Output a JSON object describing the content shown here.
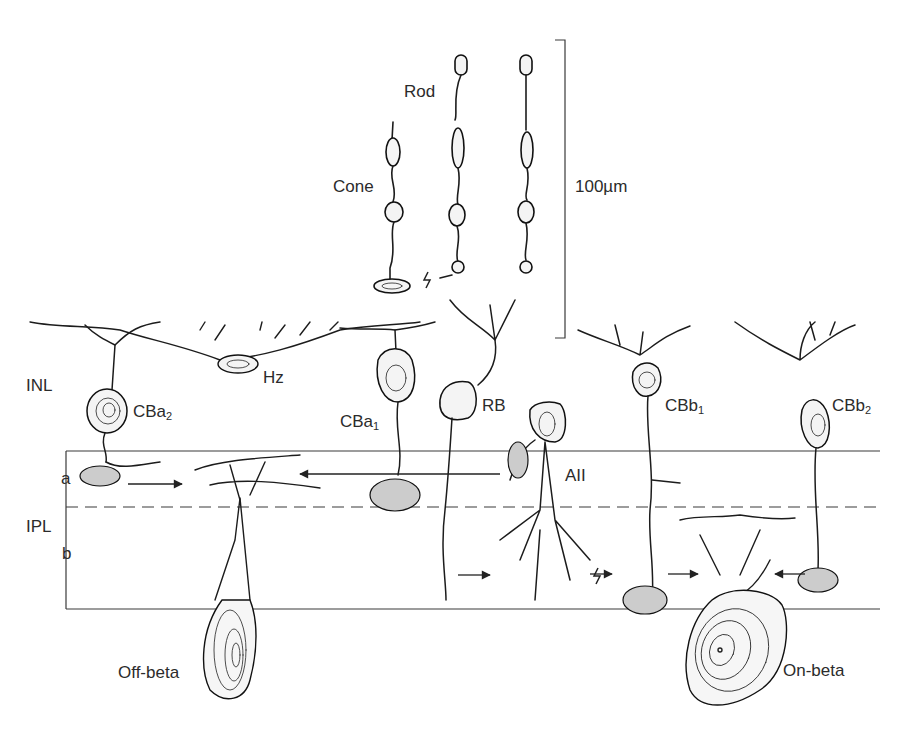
{
  "figure": {
    "type": "retinal neuron circuit diagram",
    "scale_bar": {
      "label": "100µm",
      "value": 100,
      "unit": "µm"
    },
    "layers": [
      {
        "id": "INL",
        "label": "INL"
      },
      {
        "id": "IPL",
        "label": "IPL"
      }
    ],
    "sublaminae": [
      {
        "id": "a",
        "label": "a"
      },
      {
        "id": "b",
        "label": "b"
      }
    ],
    "photoreceptors": [
      {
        "id": "cone",
        "label": "Cone"
      },
      {
        "id": "rod",
        "label": "Rod"
      }
    ],
    "cells": [
      {
        "id": "Hz",
        "label": "Hz"
      },
      {
        "id": "CBa2",
        "base": "CBa",
        "sub": "2"
      },
      {
        "id": "CBa1",
        "base": "CBa",
        "sub": "1"
      },
      {
        "id": "RB",
        "label": "RB"
      },
      {
        "id": "AII",
        "label": "AII"
      },
      {
        "id": "CBb1",
        "base": "CBb",
        "sub": "1"
      },
      {
        "id": "CBb2",
        "base": "CBb",
        "sub": "2"
      },
      {
        "id": "off-beta",
        "label": "Off-beta"
      },
      {
        "id": "on-beta",
        "label": "On-beta"
      }
    ],
    "connections": [
      {
        "from": "CBa2",
        "to": "off-beta",
        "type": "chemical"
      },
      {
        "from": "CBa1",
        "to": "off-beta",
        "type": "chemical"
      },
      {
        "from": "AII",
        "to": "CBa2",
        "type": "chemical"
      },
      {
        "from": "RB",
        "to": "AII",
        "type": "chemical"
      },
      {
        "from": "AII",
        "to": "CBb1",
        "type": "gap-junction"
      },
      {
        "from": "CBb1",
        "to": "on-beta",
        "type": "chemical"
      },
      {
        "from": "CBb2",
        "to": "on-beta",
        "type": "chemical"
      },
      {
        "from": "cone",
        "to": "rod",
        "type": "gap-junction"
      }
    ]
  }
}
